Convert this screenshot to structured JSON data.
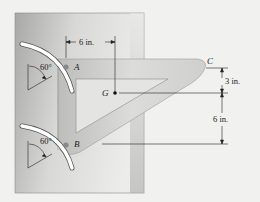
{
  "figure": {
    "type": "statics-diagram",
    "points": {
      "A": "A",
      "B": "B",
      "C": "C",
      "G": "G"
    },
    "angles": {
      "A_slot": "60°",
      "B_slot": "60°"
    },
    "dimensions": {
      "horizontal_A_to_G": "6 in.",
      "vertical_C_to_G": "3 in.",
      "vertical_G_to_B": "6 in."
    },
    "colors": {
      "background": "#f1f1ef",
      "plate_dark": "#9a9a9a",
      "plate_light": "#e6e6e4",
      "bracket": "#d2d2d0",
      "line": "#222222"
    }
  }
}
